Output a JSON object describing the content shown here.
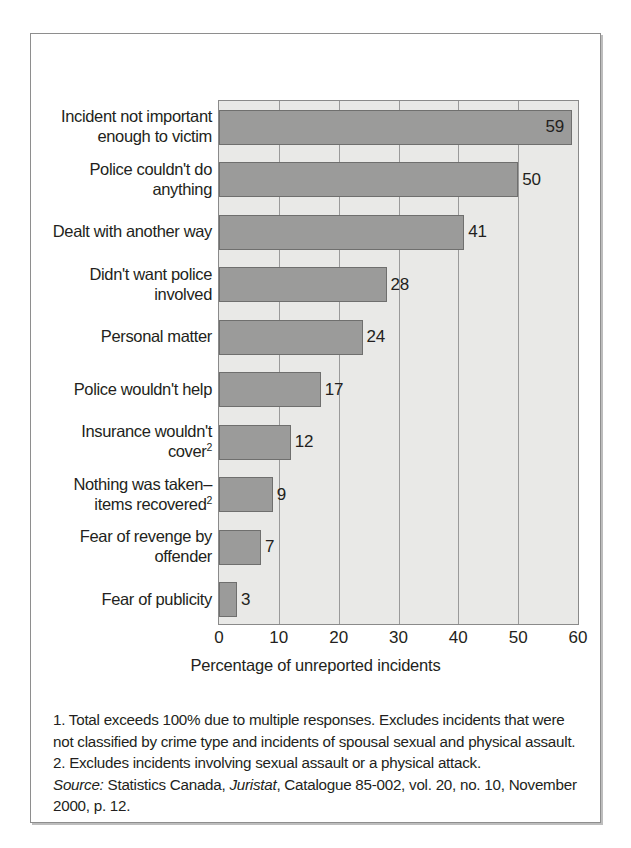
{
  "chart_data": {
    "type": "bar",
    "orientation": "horizontal",
    "title": "",
    "xlabel": "Percentage of unreported incidents",
    "ylabel": "",
    "xlim": [
      0,
      60
    ],
    "xticks": [
      0,
      10,
      20,
      30,
      40,
      50,
      60
    ],
    "grid": true,
    "legend": null,
    "categories": [
      "Incident not important enough to victim",
      "Police couldn't do anything",
      "Dealt with another way",
      "Didn't want police involved",
      "Personal matter",
      "Police wouldn't help",
      "Insurance wouldn't cover2",
      "Nothing was taken–items recovered2",
      "Fear of revenge by offender",
      "Fear of publicity"
    ],
    "values": [
      59,
      50,
      41,
      28,
      24,
      17,
      12,
      9,
      7,
      3
    ],
    "bar_color": "#9b9b9a",
    "plot_background": "#e9e9e7"
  },
  "categories": [
    {
      "lines": [
        "Incident not important",
        "enough to victim"
      ],
      "footnote": "",
      "value": 59,
      "label": "59",
      "label_position": "inside"
    },
    {
      "lines": [
        "Police couldn't do",
        "anything"
      ],
      "footnote": "",
      "value": 50,
      "label": "50",
      "label_position": "outside"
    },
    {
      "lines": [
        "Dealt with another way"
      ],
      "footnote": "",
      "value": 41,
      "label": "41",
      "label_position": "outside"
    },
    {
      "lines": [
        "Didn't want police",
        "involved"
      ],
      "footnote": "",
      "value": 28,
      "label": "28",
      "label_position": "outside"
    },
    {
      "lines": [
        "Personal matter"
      ],
      "footnote": "",
      "value": 24,
      "label": "24",
      "label_position": "outside"
    },
    {
      "lines": [
        "Police wouldn't help"
      ],
      "footnote": "",
      "value": 17,
      "label": "17",
      "label_position": "outside"
    },
    {
      "lines": [
        "Insurance wouldn't",
        "cover"
      ],
      "footnote": "2",
      "value": 12,
      "label": "12",
      "label_position": "outside"
    },
    {
      "lines": [
        "Nothing was taken–",
        "items recovered"
      ],
      "footnote": "2",
      "value": 9,
      "label": "9",
      "label_position": "outside"
    },
    {
      "lines": [
        "Fear of revenge by",
        "offender"
      ],
      "footnote": "",
      "value": 7,
      "label": "7",
      "label_position": "outside"
    },
    {
      "lines": [
        "Fear of publicity"
      ],
      "footnote": "",
      "value": 3,
      "label": "3",
      "label_position": "outside"
    }
  ],
  "axis": {
    "title": "Percentage of unreported incidents",
    "ticks": [
      "0",
      "10",
      "20",
      "30",
      "40",
      "50",
      "60"
    ]
  },
  "footnotes": {
    "note1": "1. Total exceeds 100% due to multiple responses. Excludes incidents that were not classified by crime type and incidents of spousal sexual and physical assault.",
    "note2": "2. Excludes incidents involving sexual assault or a physical attack.",
    "source_label": "Source:",
    "source_pre": " Statistics Canada, ",
    "source_italic": "Juristat",
    "source_post": ", Catalogue 85-002, vol. 20, no. 10, November 2000, p. 12."
  }
}
